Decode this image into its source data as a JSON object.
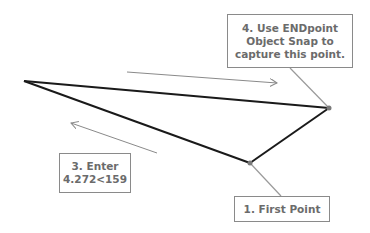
{
  "callouts": {
    "step4": {
      "lines": [
        "4. Use ENDpoint",
        "Object Snap to",
        "capture this point."
      ]
    },
    "step3": {
      "lines": [
        "3. Enter",
        "4.272<159"
      ]
    },
    "step1": {
      "lines": [
        "1. First Point"
      ]
    }
  },
  "geometry": {
    "vertices": {
      "left": [
        24,
        81
      ],
      "right": [
        329,
        108
      ],
      "bottom": [
        250,
        163
      ]
    },
    "arrows": [
      {
        "from": [
          127,
          72
        ],
        "to": [
          277,
          83
        ],
        "direction": "right"
      },
      {
        "from": [
          157,
          153
        ],
        "to": [
          71,
          123
        ],
        "direction": "left"
      }
    ]
  },
  "colors": {
    "line": "#1a1a1a",
    "leader": "#9a9a9a",
    "arrow": "#8a8a8a",
    "text": "#6b6b6b",
    "box_border": "#8a8a8a",
    "vertex": "#7a7a7a"
  }
}
